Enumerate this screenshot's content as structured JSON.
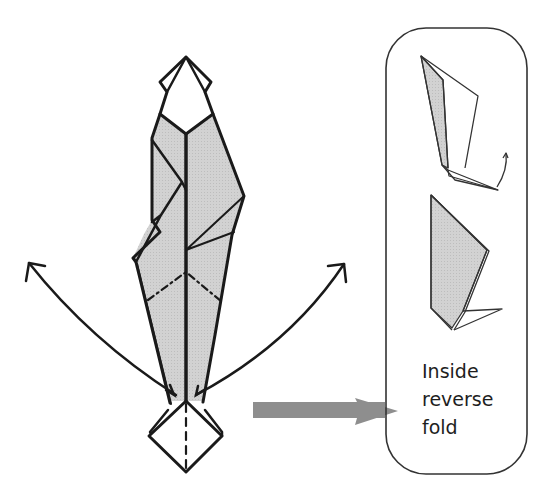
{
  "diagram": {
    "caption_lines": [
      "Inside",
      "reverse",
      "fold"
    ],
    "colors": {
      "line": "#1a1a1a",
      "paper_shade": "#cfcfcf",
      "paper_white": "#ffffff",
      "arrow_gray": "#8e8e8e",
      "box_border": "#333333"
    },
    "elements": {
      "main_model": "folded model with top and bottom diamond points, shaded center body",
      "fold_lines": "dash-dot valley/mountain lines across body, dashed center line in bottom diamond",
      "left_arrow": "curved arrow swinging leg outward to the left",
      "right_arrow": "curved arrow swinging leg outward to the right",
      "pointer_arrow": "thick gray arrow pointing to detail box",
      "detail_box": "rounded rectangle showing inside reverse fold sequence"
    }
  }
}
